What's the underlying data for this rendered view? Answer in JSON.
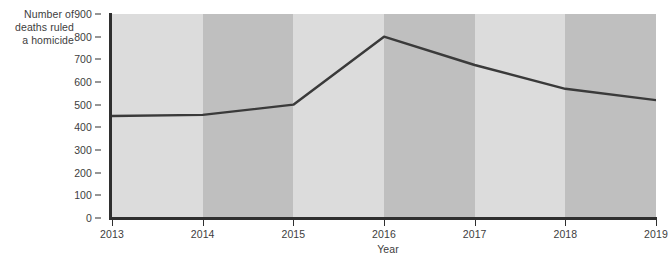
{
  "chart_data": {
    "type": "line",
    "title": "",
    "xlabel": "Year",
    "ylabel": "Number of\ndeaths ruled\na homicide",
    "x": [
      2013,
      2014,
      2015,
      2016,
      2017,
      2018,
      2019
    ],
    "xticklabels": [
      "2013",
      "2014",
      "2015",
      "2016",
      "2017",
      "2018",
      "2019"
    ],
    "values": [
      450,
      455,
      500,
      800,
      675,
      570,
      520
    ],
    "series": [
      {
        "name": "Number of deaths ruled a homicide",
        "values": [
          450,
          455,
          500,
          800,
          675,
          570,
          520
        ]
      }
    ],
    "ylim": [
      0,
      900
    ],
    "xlim": [
      2013,
      2019
    ],
    "yticks": [
      0,
      100,
      200,
      300,
      400,
      500,
      600,
      700,
      800,
      900
    ],
    "yticklabels": [
      "0",
      "100",
      "200",
      "300",
      "400",
      "500",
      "600",
      "700",
      "800",
      "900"
    ],
    "grid": false,
    "legend": "none",
    "banding": {
      "enabled": true,
      "light_color": "#dcdcdc",
      "dark_color": "#bfbfbf",
      "bands": [
        {
          "from": 2013,
          "to": 2014,
          "shade": "light"
        },
        {
          "from": 2014,
          "to": 2015,
          "shade": "dark"
        },
        {
          "from": 2015,
          "to": 2016,
          "shade": "light"
        },
        {
          "from": 2016,
          "to": 2017,
          "shade": "dark"
        },
        {
          "from": 2017,
          "to": 2018,
          "shade": "light"
        },
        {
          "from": 2018,
          "to": 2019,
          "shade": "dark"
        }
      ]
    },
    "colors": {
      "line": "#3a3a3a",
      "axis": "#2f2f2f",
      "text": "#3d3d3d",
      "background": "#ffffff"
    },
    "line_width": 2.4
  }
}
